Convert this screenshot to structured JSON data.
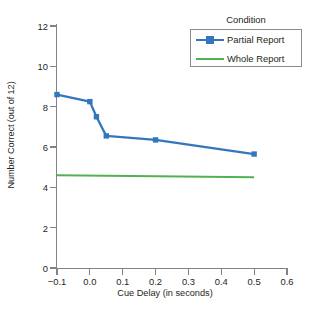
{
  "chart_data": {
    "type": "line",
    "title": "",
    "xlabel": "Cue Delay (in seconds)",
    "ylabel": "Number Correct (out of 12)",
    "xlim": [
      -0.1,
      0.6
    ],
    "ylim": [
      0,
      12
    ],
    "xticks": [
      "−0.1",
      "0.0",
      "0.1",
      "0.2",
      "0.3",
      "0.4",
      "0.5",
      "0.6"
    ],
    "xtick_values": [
      -0.1,
      0.0,
      0.1,
      0.2,
      0.3,
      0.4,
      0.5,
      0.6
    ],
    "yticks": [
      "0",
      "2",
      "4",
      "6",
      "8",
      "10",
      "12"
    ],
    "ytick_values": [
      0,
      2,
      4,
      6,
      8,
      10,
      12
    ],
    "grid": false,
    "legend_position": "top-right",
    "legend_title": "Condition",
    "series": [
      {
        "name": "Partial Report",
        "color": "#3476bd",
        "marker": "square",
        "x": [
          -0.1,
          0.0,
          0.02,
          0.05,
          0.2,
          0.5
        ],
        "values": [
          8.6,
          8.25,
          7.5,
          6.55,
          6.35,
          5.65
        ]
      },
      {
        "name": "Whole Report",
        "color": "#52b152",
        "marker": "none",
        "x": [
          -0.1,
          0.5
        ],
        "values": [
          4.6,
          4.5
        ]
      }
    ]
  },
  "legend": {
    "title": "Condition",
    "entries": [
      {
        "label": "Partial Report",
        "color": "#3476bd",
        "marker": "square"
      },
      {
        "label": "Whole Report",
        "color": "#52b152",
        "marker": "none"
      }
    ]
  },
  "axes": {
    "x_title": "Cue Delay (in seconds)",
    "y_title": "Number Correct (out of 12)"
  },
  "caption_remnant": ""
}
